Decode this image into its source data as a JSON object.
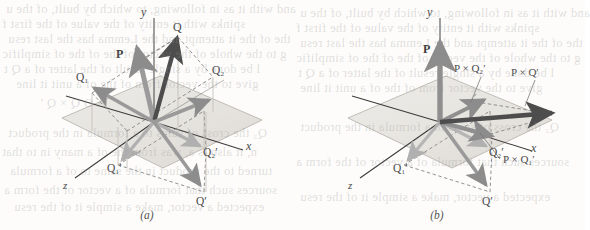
{
  "figure": {
    "title_alt": "Vector cross product construction in 3D, panels (a) and (b)",
    "panels": [
      {
        "id": "a",
        "caption": "(a)",
        "axes": {
          "x": "x",
          "y": "y",
          "z": "z"
        },
        "vector_labels": [
          {
            "name": "P",
            "text": "P"
          },
          {
            "name": "Q",
            "text": "Q"
          },
          {
            "name": "Q1",
            "text": "Q₁"
          },
          {
            "name": "Q2",
            "text": "Q₂"
          },
          {
            "name": "Q1prime",
            "text": "Q₁′"
          },
          {
            "name": "Q2prime",
            "text": "Q₂′"
          },
          {
            "name": "Qprime",
            "text": "Q′"
          }
        ]
      },
      {
        "id": "b",
        "caption": "(b)",
        "axes": {
          "x": "x",
          "y": "y",
          "z": "z"
        },
        "vector_labels": [
          {
            "name": "P",
            "text": "P"
          },
          {
            "name": "Q1prime",
            "text": "Q₁′"
          },
          {
            "name": "Q2prime",
            "text": "Q₂′"
          },
          {
            "name": "Qprime",
            "text": "Q′"
          },
          {
            "name": "PxQ2prime",
            "text": "P × Q₂′"
          },
          {
            "name": "PxQprime",
            "text": "P × Q′"
          },
          {
            "name": "PxQ1prime",
            "text": "P × Q₁′"
          }
        ]
      }
    ],
    "colors": {
      "plane_fill": "#e9e7e2",
      "plane_edge": "#b9b6b0",
      "vector_dark": "#4d4d4d",
      "vector_mid": "#8c8c8c",
      "vector_light": "#b5b5b5",
      "axis": "#3a3a3a",
      "dashed": "#7a7a7a",
      "page_background": "#fdfcfa"
    },
    "bleed_through_text": [
      "and with it as in following, to which by built, of the u",
      "spinks with it entity of the value of the first f",
      "the of the it attempt and the Lemma has the last resu",
      "g to the whole of the vector of the of the of simplific",
      "l be done by a single result of the latter of a Q t",
      "give to the vector from of the of a unit it line"
    ],
    "bleed_through_text_lower": [
      "A O Q × Q ′",
      "Q₂ the cross of sums to a formula in the product",
      "n, it also is a, was from the of a many in to that",
      "turned to the product in the same to of a formula",
      "sources such that formula of a vector of the form a",
      "expected a vector, make a simple it of the resu"
    ]
  }
}
